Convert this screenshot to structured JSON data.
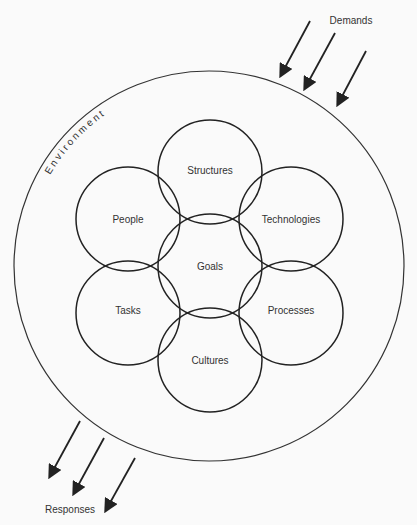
{
  "diagram": {
    "outer_label": "Environment",
    "demands_label": "Demands",
    "responses_label": "Responses",
    "circles": [
      {
        "label": "Goals",
        "cx": 210,
        "cy": 266
      },
      {
        "label": "Structures",
        "cx": 210,
        "cy": 172
      },
      {
        "label": "People",
        "cx": 128,
        "cy": 219
      },
      {
        "label": "Technologies",
        "cx": 291,
        "cy": 219
      },
      {
        "label": "Tasks",
        "cx": 128,
        "cy": 313
      },
      {
        "label": "Processes",
        "cx": 291,
        "cy": 313
      },
      {
        "label": "Cultures",
        "cx": 210,
        "cy": 360
      }
    ]
  }
}
